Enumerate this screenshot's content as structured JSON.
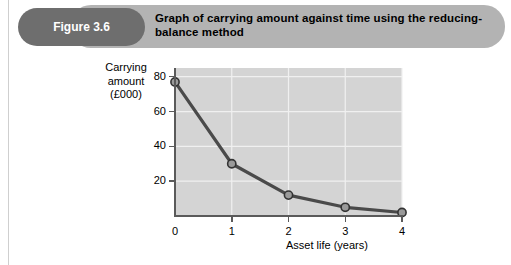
{
  "figure": {
    "badge_label": "Figure 3.6",
    "title": "Graph of carrying amount against time using the reducing-balance method",
    "badge_color": "#6e6e6e",
    "bar_color": "#b3b3b3"
  },
  "chart_data": {
    "type": "line",
    "title": "Graph of carrying amount against time using the reducing-balance method",
    "xlabel": "Asset life (years)",
    "ylabel": "Carrying amount (£000)",
    "ylabel_lines": [
      "Carrying",
      "amount",
      "(£000)"
    ],
    "x": [
      0,
      1,
      2,
      3,
      4
    ],
    "values": [
      77,
      30,
      12,
      5,
      2
    ],
    "xticks": [
      "0",
      "1",
      "2",
      "3",
      "4"
    ],
    "yticks": [
      "20",
      "40",
      "60",
      "80"
    ],
    "ytick_values": [
      20,
      40,
      60,
      80
    ],
    "xlim": [
      0,
      4
    ],
    "ylim": [
      0,
      85
    ],
    "grid": true,
    "legend": null,
    "plot_bg_color": "#d4d4d4",
    "grid_color": "#f0f0f0",
    "line_color": "#4a4a4a",
    "marker_fill": "#9a9a9a",
    "marker_edge": "#333333"
  }
}
